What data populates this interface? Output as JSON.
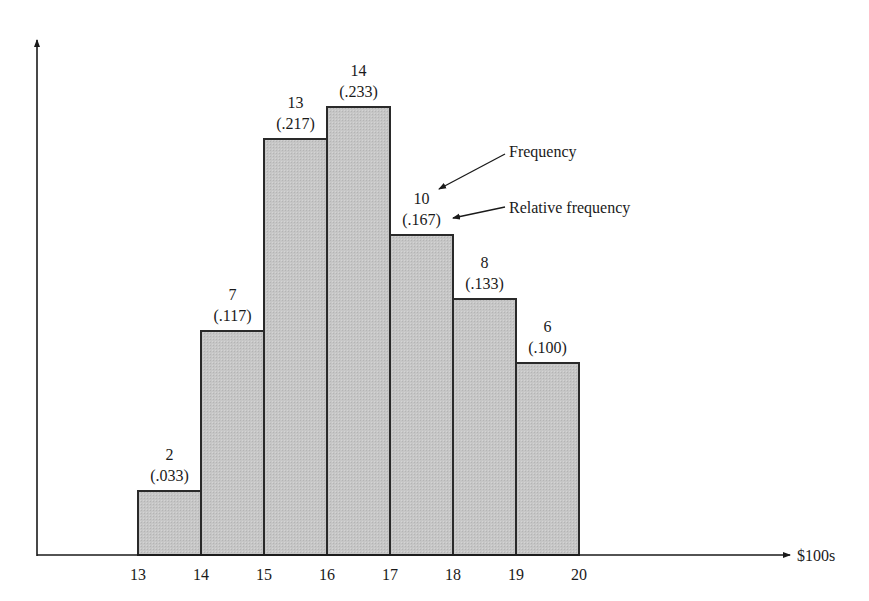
{
  "chart_data": {
    "type": "bar",
    "subtype": "histogram",
    "title": "",
    "xlabel": "$100s",
    "ylabel": "",
    "bins": [
      [
        13,
        14
      ],
      [
        14,
        15
      ],
      [
        15,
        16
      ],
      [
        16,
        17
      ],
      [
        17,
        18
      ],
      [
        18,
        19
      ],
      [
        19,
        20
      ]
    ],
    "x_ticks": [
      "13",
      "14",
      "15",
      "16",
      "17",
      "18",
      "19",
      "20"
    ],
    "frequency": [
      2,
      7,
      13,
      14,
      10,
      8,
      6
    ],
    "relative_frequency": [
      0.033,
      0.117,
      0.217,
      0.233,
      0.167,
      0.133,
      0.1
    ],
    "frequency_labels": [
      "2",
      "7",
      "13",
      "14",
      "10",
      "8",
      "6"
    ],
    "relative_frequency_labels": [
      "(.033)",
      "(.117)",
      "(.217)",
      "(.233)",
      "(.167)",
      "(.133)",
      "(.100)"
    ],
    "xlim": [
      13,
      20
    ],
    "ylim": [
      0,
      16
    ],
    "grid": false,
    "annotations": [
      {
        "text": "Frequency",
        "points_to": "frequency label of bin 17-18"
      },
      {
        "text": "Relative frequency",
        "points_to": "relative frequency label of bin 17-18"
      }
    ],
    "colors": {
      "bar_fill": "#c4c4c4",
      "bar_stroke": "#2a2a2a",
      "axis": "#1a1a1a"
    }
  }
}
